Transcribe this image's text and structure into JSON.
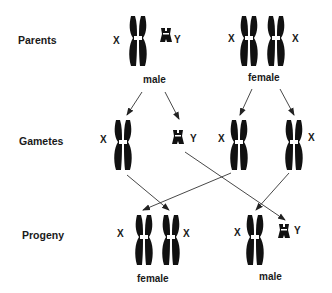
{
  "rows": {
    "parents": "Parents",
    "gametes": "Gametes",
    "progeny": "Progeny"
  },
  "parents": {
    "male": {
      "label": "male",
      "chromosomes": [
        "X",
        "Y"
      ]
    },
    "female": {
      "label": "female",
      "chromosomes": [
        "X",
        "X"
      ]
    }
  },
  "gametes": {
    "items": [
      {
        "chromosome": "X",
        "from": "male"
      },
      {
        "chromosome": "Y",
        "from": "male"
      },
      {
        "chromosome": "X",
        "from": "female"
      },
      {
        "chromosome": "X",
        "from": "female"
      }
    ]
  },
  "progeny": {
    "female": {
      "label": "female",
      "chromosomes": [
        "X",
        "X"
      ]
    },
    "male": {
      "label": "male",
      "chromosomes": [
        "X",
        "Y"
      ]
    }
  },
  "labels": {
    "x": "X",
    "y": "Y"
  },
  "colors": {
    "chromosome": "#111111",
    "arrow": "#333333",
    "background": "#ffffff"
  }
}
